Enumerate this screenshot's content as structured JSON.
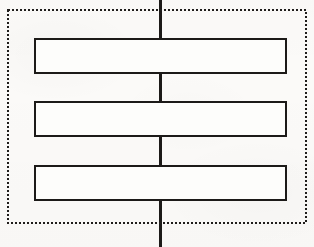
{
  "canvas": {
    "width": 314,
    "height": 247,
    "background_color": "#fbfaf8",
    "ink_color": "#1c1a18",
    "description": "Scanned line-art schematic: three stacked horizontal rectangles joined by a central vertical line, all enclosed by a dotted rectangular boundary."
  },
  "boundary": {
    "label": "dotted-enclosure",
    "style": "dotted",
    "stroke_color": "#1f1d1b",
    "stroke_width": 2,
    "dot_size": 2,
    "dot_period": 4,
    "x": 8,
    "y": 10,
    "width": 298,
    "height": 213
  },
  "center_line": {
    "label": "central-vertical-conductor",
    "stroke_color": "#1c1a18",
    "stroke_width": 3,
    "x": 160,
    "y_start": 0,
    "y_end": 247
  },
  "elements": [
    {
      "label": "rectangle-1",
      "index": 1,
      "x": 35,
      "y": 39,
      "width": 251,
      "height": 34,
      "stroke_color": "#1c1a18",
      "stroke_width": 2,
      "fill_color": "#fdfdfb"
    },
    {
      "label": "rectangle-2",
      "index": 2,
      "x": 35,
      "y": 102,
      "width": 251,
      "height": 34,
      "stroke_color": "#1c1a18",
      "stroke_width": 2,
      "fill_color": "#fdfdfb"
    },
    {
      "label": "rectangle-3",
      "index": 3,
      "x": 35,
      "y": 166,
      "width": 251,
      "height": 34,
      "stroke_color": "#1c1a18",
      "stroke_width": 2,
      "fill_color": "#fdfdfb"
    }
  ]
}
